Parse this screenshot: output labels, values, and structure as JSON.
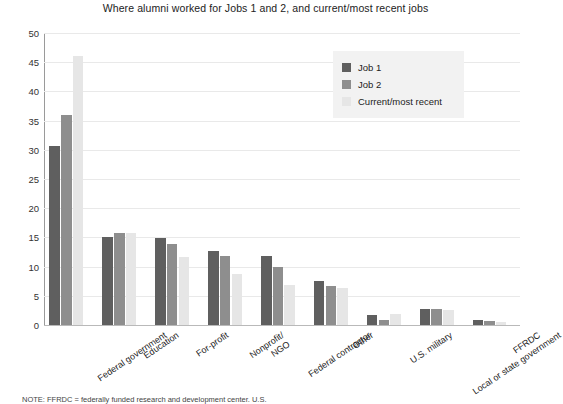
{
  "chart_data": {
    "type": "bar",
    "title": "Where alumni worked for Jobs 1 and 2, and current/most recent jobs",
    "xlabel": "",
    "ylabel": "",
    "ylim": [
      0,
      50
    ],
    "ytick_step": 5,
    "yticks": [
      "50",
      "45",
      "40",
      "35",
      "30",
      "25",
      "20",
      "15",
      "10",
      "5",
      "0"
    ],
    "grid": true,
    "legend_position": "top-right",
    "categories": [
      "Federal government",
      "Education",
      "For-profit",
      "Nonprofit/ NGO",
      "Federal contractor",
      "Other",
      "U.S. military",
      "Local or state government",
      "FFRDC"
    ],
    "series": [
      {
        "name": "Job 1",
        "color": "#5f5f5f",
        "values": [
          30.7,
          15.0,
          14.9,
          12.7,
          11.8,
          7.6,
          1.8,
          2.8,
          0.8
        ]
      },
      {
        "name": "Job 2",
        "color": "#8e8e8e",
        "values": [
          36.0,
          15.7,
          13.8,
          11.9,
          10.0,
          6.6,
          0.8,
          2.8,
          0.7
        ]
      },
      {
        "name": "Current/most recent",
        "color": "#e6e6e6",
        "values": [
          46.0,
          15.7,
          11.7,
          8.8,
          6.9,
          6.3,
          1.9,
          2.5,
          0.6
        ]
      }
    ]
  },
  "legend": {
    "items": [
      {
        "label": "Job 1",
        "color": "#5f5f5f"
      },
      {
        "label": "Job 2",
        "color": "#8e8e8e"
      },
      {
        "label": "Current/most recent",
        "color": "#e6e6e6"
      }
    ]
  },
  "footnote": {
    "text": "NOTE: FFRDC = federally funded research and development center. U.S."
  }
}
